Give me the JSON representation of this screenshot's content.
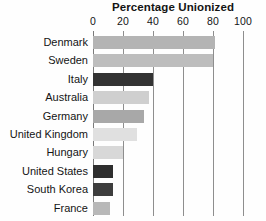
{
  "chart_data": {
    "type": "bar",
    "orientation": "horizontal",
    "title": "Percentage Unionized",
    "xlabel": "",
    "ylabel": "",
    "xlim": [
      0,
      100
    ],
    "xticks": [
      0,
      20,
      40,
      60,
      80,
      100
    ],
    "xtick_labels": [
      "0",
      "20",
      "40",
      "60",
      "80",
      "100"
    ],
    "grid": true,
    "legend": "none",
    "categories": [
      "Denmark",
      "Sweden",
      "Italy",
      "Australia",
      "Germany",
      "United Kingdom",
      "Hungary",
      "United States",
      "South Korea",
      "France"
    ],
    "values": [
      81,
      80,
      40,
      37,
      34,
      29,
      20,
      13,
      13,
      11
    ],
    "bar_colors": [
      "#b4b4b4",
      "#bdbdbd",
      "#333333",
      "#cfcfcf",
      "#a8a8a8",
      "#e0e0e0",
      "#d8d8d8",
      "#2e2e2e",
      "#3d3d3d",
      "#b8b8b8"
    ]
  },
  "axis": {
    "tick_0": "0",
    "tick_20": "20",
    "tick_40": "40",
    "tick_60": "60",
    "tick_80": "80",
    "tick_100": "100"
  },
  "title": "Percentage Unionized",
  "colors": {
    "gridline": "#8e8e8e",
    "text": "#141414",
    "background": "#fefefe"
  }
}
